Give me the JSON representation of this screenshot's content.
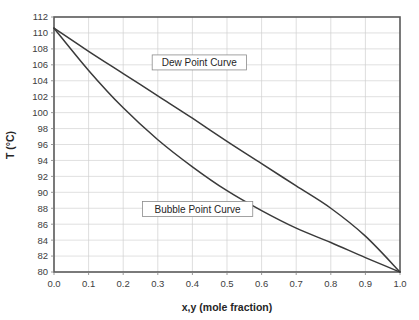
{
  "chart_data": {
    "type": "line",
    "title": "",
    "xlabel": "x,y (mole fraction)",
    "ylabel": "T (°C)",
    "xlim": [
      0.0,
      1.0
    ],
    "ylim": [
      80,
      112
    ],
    "grid": true,
    "legend_position": "inline-annotations",
    "xticks": [
      "0.0",
      "0.1",
      "0.2",
      "0.3",
      "0.4",
      "0.5",
      "0.6",
      "0.7",
      "0.8",
      "0.9",
      "1.0"
    ],
    "xtick_values": [
      0.0,
      0.1,
      0.2,
      0.3,
      0.4,
      0.5,
      0.6,
      0.7,
      0.8,
      0.9,
      1.0
    ],
    "yticks": [
      "80",
      "82",
      "84",
      "86",
      "88",
      "90",
      "92",
      "94",
      "96",
      "98",
      "100",
      "102",
      "104",
      "106",
      "108",
      "110",
      "112"
    ],
    "ytick_values": [
      80,
      82,
      84,
      86,
      88,
      90,
      92,
      94,
      96,
      98,
      100,
      102,
      104,
      106,
      108,
      110,
      112
    ],
    "x": [
      0.0,
      0.1,
      0.2,
      0.3,
      0.4,
      0.5,
      0.6,
      0.7,
      0.8,
      0.9,
      1.0
    ],
    "series": [
      {
        "name": "Dew Point Curve",
        "values": [
          110.6,
          107.7,
          104.9,
          102.1,
          99.3,
          96.4,
          93.6,
          90.8,
          88.0,
          84.5,
          80.0
        ]
      },
      {
        "name": "Bubble Point Curve",
        "values": [
          110.6,
          105.3,
          100.6,
          96.6,
          93.2,
          90.2,
          87.7,
          85.5,
          83.7,
          81.8,
          80.0
        ]
      }
    ],
    "annotations": [
      {
        "text": "Dew Point Curve",
        "x": 0.42,
        "y": 106.3
      },
      {
        "text": "Bubble Point Curve",
        "x": 0.415,
        "y": 87.9
      }
    ],
    "colors": {
      "curve": "#3a3a3a",
      "grid": "#d2d2d2",
      "frame": "#595959",
      "text": "#404040",
      "background": "#ffffff"
    }
  }
}
